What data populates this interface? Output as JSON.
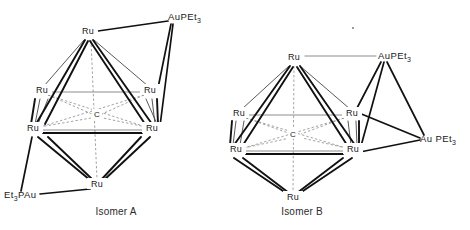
{
  "figure": {
    "background_color": "#ffffff",
    "ink_color": "#111111",
    "dashed_color": "#8a8a8a"
  },
  "labels": {
    "ru": "Ru",
    "carbide": "C",
    "aupet3": "AuPEt",
    "et3pau": "Et",
    "aupet3_prefix": "Au PEt",
    "subscript_3": "3"
  },
  "isomers": [
    {
      "id": "isomer-a",
      "caption": "Isomer A",
      "caption_x": 116,
      "caption_y": 215,
      "core": {
        "type": "octahedron",
        "center_label": "C",
        "center": {
          "x": 97,
          "y": 115
        },
        "vertices": [
          {
            "name": "ru-apex-top",
            "label": "Ru",
            "x": 88,
            "y": 33,
            "anchor": "middle"
          },
          {
            "name": "ru-upper-left",
            "label": "Ru",
            "x": 42,
            "y": 92,
            "anchor": "middle"
          },
          {
            "name": "ru-upper-right",
            "label": "Ru",
            "x": 150,
            "y": 92,
            "anchor": "middle"
          },
          {
            "name": "ru-lower-left",
            "label": "Ru",
            "x": 33,
            "y": 130,
            "anchor": "middle"
          },
          {
            "name": "ru-lower-right",
            "label": "Ru",
            "x": 152,
            "y": 130,
            "anchor": "middle"
          },
          {
            "name": "ru-apex-bottom",
            "label": "Ru",
            "x": 97,
            "y": 186,
            "anchor": "middle"
          }
        ]
      },
      "ligands": [
        {
          "name": "aupet3-top-right",
          "text": "AuPEt",
          "subscript": "3",
          "x": 168,
          "y": 17,
          "anchor": "start",
          "attach_point": {
            "x": 172,
            "y": 22
          },
          "bonded_to": [
            "ru-apex-top",
            "ru-upper-right",
            "ru-lower-right"
          ]
        },
        {
          "name": "et3pau-bottom-left",
          "text": "Et",
          "subscript": "3",
          "text_tail": "PAu",
          "x": 4,
          "y": 198,
          "anchor": "start",
          "attach_point": {
            "x": 37,
            "y": 194
          },
          "bonded_to": [
            "ru-lower-left",
            "ru-apex-bottom"
          ]
        }
      ]
    },
    {
      "id": "isomer-b",
      "caption": "Isomer B",
      "caption_x": 302,
      "caption_y": 215,
      "core": {
        "type": "octahedron",
        "center_label": "C",
        "center": {
          "x": 296,
          "y": 135
        },
        "vertices": [
          {
            "name": "ru-apex-top",
            "label": "Ru",
            "x": 294,
            "y": 59,
            "anchor": "middle"
          },
          {
            "name": "ru-upper-left",
            "label": "Ru",
            "x": 239,
            "y": 115,
            "anchor": "middle"
          },
          {
            "name": "ru-upper-right",
            "label": "Ru",
            "x": 352,
            "y": 115,
            "anchor": "middle"
          },
          {
            "name": "ru-lower-left",
            "label": "Ru",
            "x": 236,
            "y": 151,
            "anchor": "middle"
          },
          {
            "name": "ru-lower-right",
            "label": "Ru",
            "x": 353,
            "y": 151,
            "anchor": "middle"
          },
          {
            "name": "ru-apex-bottom",
            "label": "Ru",
            "x": 293,
            "y": 199,
            "anchor": "middle"
          }
        ]
      },
      "ligands": [
        {
          "name": "aupet3-upper-right",
          "text": "AuPEt",
          "subscript": "3",
          "x": 378,
          "y": 59,
          "anchor": "start",
          "attach_point": {
            "x": 382,
            "y": 63
          },
          "bonded_to": [
            "ru-apex-top",
            "ru-upper-right",
            "ru-lower-right"
          ]
        },
        {
          "name": "aupet3-lower-right",
          "text": "Au PEt",
          "subscript": "3",
          "x": 422,
          "y": 142,
          "anchor": "start",
          "attach_point": {
            "x": 421,
            "y": 138
          },
          "bonded_to": [
            "ru-upper-right",
            "ru-lower-right"
          ]
        }
      ]
    }
  ]
}
